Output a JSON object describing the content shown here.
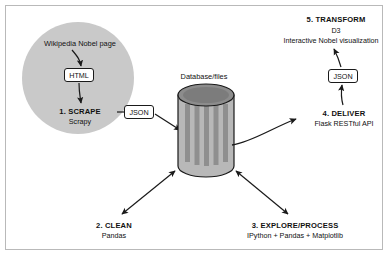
{
  "diagram": {
    "colors": {
      "circle_fill": "#c9c9c9",
      "cylinder_body": "#b8b8b8",
      "cylinder_stripe": "#8f8f8f",
      "cylinder_top": "#8c8c8c",
      "stroke": "#1a1a1a",
      "frame": "#b9b9b9",
      "background": "#ffffff"
    },
    "source": {
      "label": "Wikipedia Nobel page"
    },
    "tags": {
      "html": "HTML",
      "json_left": "JSON",
      "json_right": "JSON"
    },
    "store": {
      "label": "Database/files"
    },
    "steps": [
      {
        "id": "scrape",
        "title": "1. SCRAPE",
        "subtitle": "Scrapy"
      },
      {
        "id": "clean",
        "title": "2. CLEAN",
        "subtitle": "Pandas"
      },
      {
        "id": "explore",
        "title": "3. EXPLORE/PROCESS",
        "subtitle": "IPython + Pandas + Matplotlib"
      },
      {
        "id": "deliver",
        "title": "4. DELIVER",
        "subtitle": "Flask RESTful API"
      },
      {
        "id": "transform",
        "title": "5. TRANSFORM",
        "subtitle_line1": "D3",
        "subtitle_line2": "Interactive Nobel visualization"
      }
    ]
  }
}
